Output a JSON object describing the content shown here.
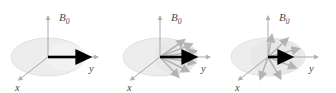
{
  "figure": {
    "background_color": "#ffffff",
    "width": 336,
    "height": 93,
    "panel_count": 3
  },
  "style": {
    "axis_color": "#a8a8a8",
    "axis_arrow_color": "#b0b0b0",
    "disc_fill": "#ededed",
    "disc_stroke": "#dcdcdc",
    "wedge_fill": "#e0e0e0",
    "net_vector_color": "#000000",
    "spin_vector_color": "#b4b4b4",
    "label_color": "#4a4a4a"
  },
  "labels": {
    "b0": "B",
    "b0_subscript": "0",
    "y": "y",
    "x": "x"
  },
  "panels": [
    {
      "id": "panel-1",
      "caption": "",
      "state": "coherent",
      "net_vector": {
        "label": "M",
        "angle_deg": 0,
        "length": 52,
        "color": "#000000"
      },
      "spin_vectors": {
        "count": 0,
        "fan_half_angle_deg": 0,
        "angles_deg": []
      },
      "axes": [
        {
          "name": "B0",
          "direction": "up",
          "label": "B0"
        },
        {
          "name": "y",
          "direction": "right",
          "label": "y"
        },
        {
          "name": "x",
          "direction": "down-left",
          "label": "x"
        }
      ]
    },
    {
      "id": "panel-2",
      "caption": "",
      "state": "partially-dephased",
      "net_vector": {
        "label": "M",
        "angle_deg": 0,
        "length": 38,
        "color": "#000000"
      },
      "spin_vectors": {
        "count": 6,
        "fan_half_angle_deg": 55,
        "angles_deg": [
          -55,
          -33,
          -11,
          11,
          33,
          55
        ]
      },
      "axes": [
        {
          "name": "B0",
          "direction": "up",
          "label": "B0"
        },
        {
          "name": "y",
          "direction": "right",
          "label": "y"
        },
        {
          "name": "x",
          "direction": "down-left",
          "label": "x"
        }
      ]
    },
    {
      "id": "panel-3",
      "caption": "",
      "state": "fully-dephased",
      "net_vector": {
        "label": "M",
        "angle_deg": 0,
        "length": 20,
        "color": "#000000"
      },
      "spin_vectors": {
        "count": 6,
        "fan_half_angle_deg": 85,
        "angles_deg": [
          -85,
          -51,
          -17,
          17,
          51,
          85
        ]
      },
      "axes": [
        {
          "name": "B0",
          "direction": "up",
          "label": "B0"
        },
        {
          "name": "y",
          "direction": "right",
          "label": "y"
        },
        {
          "name": "x",
          "direction": "down-left",
          "label": "x"
        }
      ]
    }
  ]
}
